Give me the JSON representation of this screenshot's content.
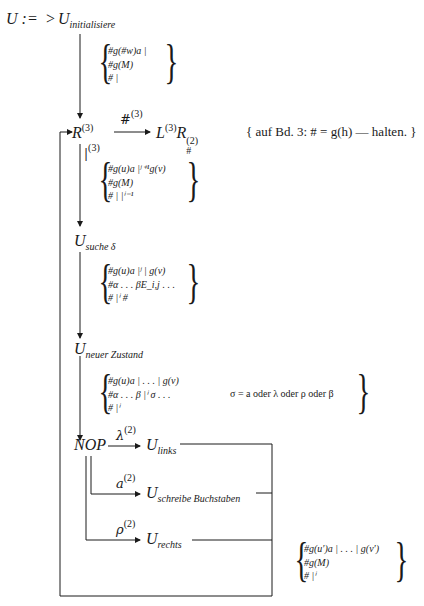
{
  "diagram": {
    "title_lhs": "U :=",
    "start_marker": ">",
    "nodes": {
      "init": {
        "base": "U",
        "sub": "initialisiere"
      },
      "r3": {
        "base": "R",
        "sup": "(3)"
      },
      "l3r2": {
        "base1": "L",
        "sup1": "(3)",
        "base2": "R",
        "sup2": "(2)",
        "sub2": "#"
      },
      "suche": {
        "base": "U",
        "sub": "suche δ"
      },
      "neuer": {
        "base": "U",
        "sub": "neuer Zustand"
      },
      "nop": {
        "label": "NOP"
      },
      "links": {
        "base": "U",
        "sub": "links"
      },
      "schreibe": {
        "base": "U",
        "sub": "schreibe Buchstaben"
      },
      "rechts": {
        "base": "U",
        "sub": "rechts"
      }
    },
    "edges": {
      "r3_to_l3r2": {
        "label": "#",
        "sup": "(3)"
      },
      "r3_down": {
        "label": "|",
        "sup": "(3)"
      },
      "nop_links": {
        "label": "λ",
        "sup": "(2)"
      },
      "nop_schreibe": {
        "label": "a",
        "sup": "(2)"
      },
      "nop_rechts": {
        "label": "ρ",
        "sup": "(2)"
      }
    },
    "note": "{ auf Bd. 3: # = g(h) — halten. }",
    "conditions": {
      "c1": [
        "#g(#w)a |",
        "#g(M)",
        "# |"
      ],
      "c2": [
        "#g(u)a |ʲ⁺¹g(v)",
        "#g(M)",
        "# | |ⁱ⁻¹"
      ],
      "c3": [
        "#g(u)a |ʲ | g(v)",
        "#α . . . βE_i,j . . .",
        "# |ⁱ #"
      ],
      "c4": [
        "#g(u)a | . . . | g(v)",
        "#α . . . β |ⁱ σ . . .",
        "# |ⁱ"
      ],
      "c4_note": "σ = a oder λ oder ρ oder β",
      "c5": [
        "#g(u′)a | . . . | g(v′)",
        "#g(M)",
        "# |ⁱ"
      ]
    }
  }
}
